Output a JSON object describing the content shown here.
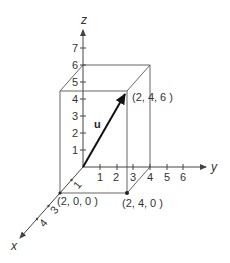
{
  "diagram": {
    "type": "3d-vector-box",
    "axes": {
      "x": {
        "label": "x",
        "ticks": [
          "1",
          "2",
          "3",
          "4"
        ]
      },
      "y": {
        "label": "y",
        "ticks": [
          "1",
          "2",
          "3",
          "4",
          "5",
          "6"
        ]
      },
      "z": {
        "label": "z",
        "ticks": [
          "1",
          "2",
          "3",
          "4",
          "5",
          "6",
          "7"
        ]
      }
    },
    "vector": {
      "name": "u",
      "from": [
        0,
        0,
        0
      ],
      "to": [
        2,
        4,
        6
      ]
    },
    "points": [
      {
        "label": "(2, 0, 0 )",
        "coords": [
          2,
          0,
          0
        ]
      },
      {
        "label": "(2, 4, 0 )",
        "coords": [
          2,
          4,
          0
        ]
      },
      {
        "label": "(2, 4, 6 )",
        "coords": [
          2,
          4,
          6
        ]
      }
    ],
    "box": {
      "x": 2,
      "y": 4,
      "z": 6
    },
    "colors": {
      "line": "#555555",
      "vector": "#222222",
      "text": "#333333",
      "background": "#ffffff"
    }
  }
}
